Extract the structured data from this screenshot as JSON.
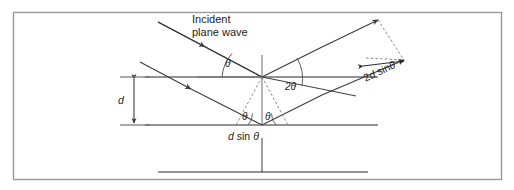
{
  "figure": {
    "name": "bragg-diffraction-diagram",
    "type": "physics-schematic",
    "border_color": "#9a9a9a",
    "line_color": "#3c3c3c",
    "plane_color": "#6b6b6b",
    "background": "#ffffff"
  },
  "labels": {
    "incident_line1": "Incident",
    "incident_line2": "plane wave",
    "theta_top": "θ",
    "two_theta": "2θ",
    "theta_left_lower": "θ",
    "theta_right_lower": "θ",
    "d_spacing": "d",
    "path_difference_lower": "d sin θ",
    "path_difference_upper": "2d sinθ"
  },
  "math_parts": {
    "d_italic": "d",
    "sin_text": "sin",
    "theta_symbol": "θ",
    "two_prefix": "2",
    "sin_nospace": "sin"
  },
  "geometry": {
    "vertex_x": 262,
    "vertex_y": 77,
    "upper_plane_y": 77,
    "lower_plane_y": 125,
    "bottom_plane_y": 172,
    "plane_left_x": 145,
    "plane_right_x": 378,
    "interplanar_spacing_label": "d"
  }
}
